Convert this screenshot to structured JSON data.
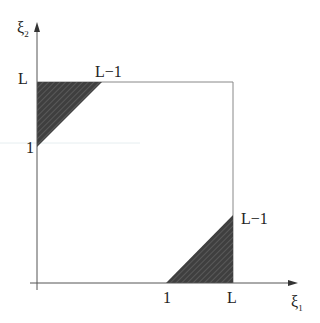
{
  "diagram": {
    "type": "region-plot",
    "axes": {
      "x_label": "ξ",
      "x_label_sub": "1",
      "y_label": "ξ",
      "y_label_sub": "2"
    },
    "ticks": {
      "y_top": "L",
      "y_one": "1",
      "x_one": "1",
      "x_right": "L"
    },
    "corner_labels": {
      "top_region": "L−1",
      "right_region": "L−1"
    },
    "colors": {
      "axis": "#333333",
      "box": "#888888",
      "fill": "#3f3f3f",
      "hatch": "#6a6a6a"
    },
    "regions": [
      {
        "name": "upper-left-triangle",
        "vertices": [
          [
            "0",
            "L"
          ],
          [
            "L-1",
            "L"
          ],
          [
            "0",
            "1"
          ]
        ]
      },
      {
        "name": "lower-right-triangle",
        "vertices": [
          [
            "1",
            "0"
          ],
          [
            "L",
            "0"
          ],
          [
            "L",
            "L-1"
          ]
        ]
      }
    ]
  }
}
